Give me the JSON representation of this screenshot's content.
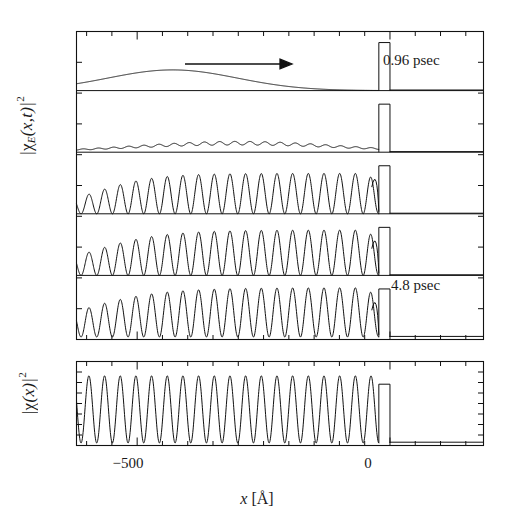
{
  "figure": {
    "title": "",
    "background": "#ffffff",
    "ink": "#111111",
    "width": 514,
    "height": 524
  },
  "axis": {
    "xlabel_var": "x",
    "xlabel_unit": "[Å]",
    "xticklabels": [
      "−500",
      "0"
    ],
    "xtick_values": [
      -500,
      0
    ],
    "xlim": [
      -620,
      185
    ],
    "xmajor_positions_px": [
      128,
      368
    ],
    "ylabel_top": "|χ",
    "ylabel_top_sub": "E",
    "ylabel_top_arg": "(x,t)|",
    "ylabel_top_exp": "2",
    "ylabel_bottom": "|χ",
    "ylabel_bottom_arg": "(x)|",
    "ylabel_bottom_exp": "2"
  },
  "annotations": {
    "time_first": "0.96 psec",
    "time_last": "4.8 psec",
    "arrow_name": "propagation-direction-arrow"
  },
  "chart_data": {
    "type": "line",
    "title": "",
    "xlabel": "x [Å]",
    "ylabel": "|χ_E(x,t)|^2  and  |χ(x)|^2",
    "xlim": [
      -620,
      185
    ],
    "xticks": [
      -500,
      0
    ],
    "grid": false,
    "legend": "none",
    "barrier": {
      "label": "potential-well",
      "x_start": -22,
      "x_end": 0,
      "height_frac": 0.78,
      "description": "Narrow rectangular well drawn at the origin in every panel"
    },
    "panels": [
      {
        "name": "panel-1",
        "time_label": "0.96 psec",
        "time_psec": 0.96,
        "description": "Broad smooth gaussian-like wavepacket centred near -430 A, no interference fringes yet; zero beyond -250 A.",
        "envelope_center": -430,
        "envelope_width": 210,
        "peak_amplitude": 0.42,
        "n_oscillations": 0,
        "oscillation_wavelength": 0
      },
      {
        "name": "panel-2",
        "time_label": "1.9 psec",
        "time_psec": 1.9,
        "description": "Wavepacket has spread and shifted right, broad flat-topped envelope from -560 to -60 A, faint ripples appear near the barrier.",
        "envelope_center": -300,
        "envelope_width": 330,
        "peak_amplitude": 0.34,
        "n_oscillations": 3,
        "oscillation_wavelength": 30
      },
      {
        "name": "panel-3",
        "time_label": "2.9 psec",
        "time_psec": 2.9,
        "description": "Reflection interference sets in: standing-wave fringes grow monotonically from left toward the barrier, large spike just left of the well, exponential tail to the right.",
        "envelope_center": -250,
        "envelope_width": 360,
        "peak_amplitude": 0.82,
        "n_oscillations": 15,
        "oscillation_wavelength": 31
      },
      {
        "name": "panel-4",
        "time_label": "3.8 psec",
        "time_psec": 3.8,
        "description": "Fringe pattern fills most of the box; amplitude ramps up from about -600 A and saturates near the barrier.",
        "envelope_center": -200,
        "envelope_width": 420,
        "peak_amplitude": 0.92,
        "n_oscillations": 18,
        "oscillation_wavelength": 31
      },
      {
        "name": "panel-5",
        "time_label": "4.8 psec",
        "time_psec": 4.8,
        "description": "Nearly fully developed standing wave across the whole region left of the well; a few small-amplitude beats remain at the far left edge.",
        "envelope_center": -180,
        "envelope_width": 470,
        "peak_amplitude": 1.0,
        "n_oscillations": 19,
        "oscillation_wavelength": 31
      },
      {
        "name": "panel-steady-state",
        "time_label": "",
        "time_psec": null,
        "description": "Stationary scattering eigenstate |chi(x)|^2: uniform standing wave of constant amplitude for x < 0 with nodes touching zero, decaying to a flat near-zero line for x > 0.",
        "envelope_center": -300,
        "envelope_width": 600,
        "peak_amplitude": 1.0,
        "n_oscillations": 19,
        "oscillation_wavelength": 31
      }
    ]
  }
}
